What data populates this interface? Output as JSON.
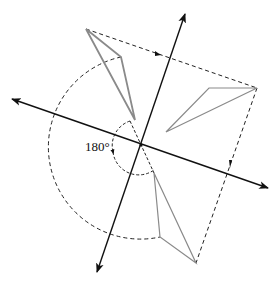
{
  "diagram": {
    "angle_label": "180°",
    "colors": {
      "axis": "#111111",
      "dashed": "#222222",
      "triangle": "#8a8a8a"
    },
    "center": [
      141,
      145
    ],
    "axes": [
      {
        "name": "line-1",
        "from": [
          97,
          272
        ],
        "to": [
          185,
          14
        ]
      },
      {
        "name": "line-2",
        "from": [
          12,
          99
        ],
        "to": [
          268,
          188
        ]
      }
    ],
    "triangles": [
      {
        "name": "original",
        "points": [
          [
            86,
            29
          ],
          [
            121,
            57
          ],
          [
            135,
            120
          ]
        ]
      },
      {
        "name": "reflected-right",
        "points": [
          [
            257,
            88
          ],
          [
            209,
            88
          ],
          [
            166,
            132
          ]
        ]
      },
      {
        "name": "rotated-180",
        "points": [
          [
            196,
            263
          ],
          [
            160,
            237
          ],
          [
            154,
            173
          ]
        ]
      }
    ]
  }
}
